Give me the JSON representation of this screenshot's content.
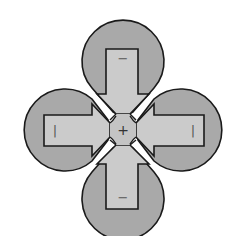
{
  "diagram": {
    "title": "",
    "colors": {
      "lobe_fill": "#a9a9a9",
      "shaft_fill": "#cbcbcb",
      "center_fill": "#c4c4c4",
      "outline": "#1a1a1a",
      "background": "#ffffff"
    },
    "lobes": [
      {
        "position": "top",
        "label": "−"
      },
      {
        "position": "left",
        "label": "|"
      },
      {
        "position": "right",
        "label": "|"
      },
      {
        "position": "bottom",
        "label": "−"
      }
    ],
    "center": {
      "label": "+"
    }
  }
}
